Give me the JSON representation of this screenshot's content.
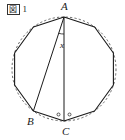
{
  "figure": {
    "caption_prefix": "図",
    "caption_number": "1",
    "caption_full": "図1",
    "type": "inscribed regular polygon with circumscribed dashed circle"
  },
  "labels": {
    "apex": "A",
    "lower_left": "B",
    "bottom": "C",
    "angle_unknown": "x"
  },
  "marks": {
    "degree_left": "◦",
    "degree_right": "◦"
  },
  "colors": {
    "stroke": "#1a1a1a",
    "dashed_circle": "#555555",
    "background": "#ffffff",
    "text": "#1a1a1a"
  },
  "geometry": {
    "sides": 10,
    "center_x": 64,
    "center_y": 69,
    "radius": 52,
    "vertices": [
      {
        "name": "A",
        "x": 64.0,
        "y": 17.0
      },
      {
        "name": "",
        "x": 94.6,
        "y": 27.0
      },
      {
        "name": "",
        "x": 113.4,
        "y": 53.0
      },
      {
        "name": "",
        "x": 113.4,
        "y": 85.0
      },
      {
        "name": "",
        "x": 94.6,
        "y": 111.0
      },
      {
        "name": "C",
        "x": 64.0,
        "y": 121.0
      },
      {
        "name": "B",
        "x": 33.4,
        "y": 111.0
      },
      {
        "name": "",
        "x": 14.6,
        "y": 85.0
      },
      {
        "name": "",
        "x": 14.6,
        "y": 53.0
      },
      {
        "name": "",
        "x": 33.4,
        "y": 27.0
      }
    ],
    "chords": [
      {
        "name": "diameter-AC",
        "from": "A",
        "to": "C"
      },
      {
        "name": "chord-AB",
        "from": "A",
        "to": "B"
      }
    ]
  }
}
